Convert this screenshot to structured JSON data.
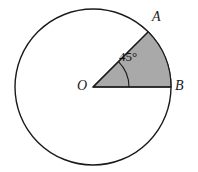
{
  "figure": {
    "type": "geometry-diagram",
    "background_color": "#ffffff",
    "stroke_color": "#1a1a1a",
    "sector_fill_color": "#a9a9a9",
    "labels": {
      "center": "O",
      "point_a": "A",
      "point_b": "B",
      "angle": "45°"
    },
    "geometry": {
      "center_x": 93,
      "center_y": 87,
      "radius": 78,
      "circle_stroke_width": 1.4,
      "sector_start_angle_deg": 0,
      "sector_end_angle_deg": 45,
      "sector_stroke_width": 1.2,
      "angle_arc_radius": 36,
      "angle_arc_stroke_width": 1.1
    }
  }
}
